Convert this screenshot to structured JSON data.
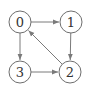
{
  "diagram": {
    "type": "directed-graph",
    "nodes": [
      {
        "id": "0",
        "label": "0"
      },
      {
        "id": "1",
        "label": "1"
      },
      {
        "id": "2",
        "label": "2"
      },
      {
        "id": "3",
        "label": "3"
      }
    ],
    "edges": [
      {
        "from": "0",
        "to": "1"
      },
      {
        "from": "1",
        "to": "2"
      },
      {
        "from": "0",
        "to": "3"
      },
      {
        "from": "3",
        "to": "2"
      },
      {
        "from": "2",
        "to": "0"
      }
    ],
    "colors": {
      "stroke": "#6e6e6e",
      "text": "#333333",
      "background": "#ffffff"
    }
  }
}
